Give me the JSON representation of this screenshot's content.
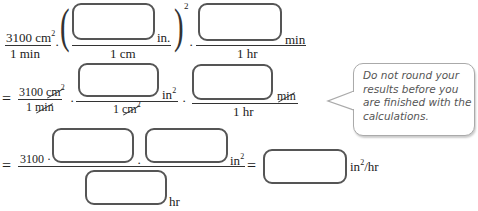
{
  "row1": {
    "lead_num": "3100 cm",
    "lead_num_exp": "2",
    "lead_den": "1 min",
    "dot": "·",
    "paren_open": "(",
    "paren_close": ")",
    "paren_exp": "2",
    "frac1_unit": "in.",
    "frac1_den": "1 cm",
    "frac2_unit": "min",
    "frac2_den": "1 hr"
  },
  "row2": {
    "equals": "=",
    "lead_num_value": "3100",
    "lead_num_unit": "cm",
    "lead_num_exp": "2",
    "lead_den_value": "1",
    "lead_den_unit": "min",
    "frac1_unit": "in",
    "frac1_unit_exp": "2",
    "frac1_den_value": "1",
    "frac1_den_unit": "cm",
    "frac1_den_exp": "2",
    "frac2_unit": "min",
    "frac2_den": "1 hr"
  },
  "row3": {
    "equals": "=",
    "num_lead": "3100 ·",
    "dot": "·",
    "num_unit": "in",
    "num_unit_exp": "2",
    "den_unit": "hr",
    "equals2": "=",
    "result_unit_pre": "in",
    "result_unit_exp": "2",
    "result_unit_post": "/hr"
  },
  "inputs": {
    "box1": "",
    "box2": "",
    "box3": "",
    "box4": "",
    "box5": "",
    "box6": "",
    "box7": "",
    "result": ""
  },
  "hint": {
    "text": "Do not round your results before you are finished with the calculations."
  }
}
